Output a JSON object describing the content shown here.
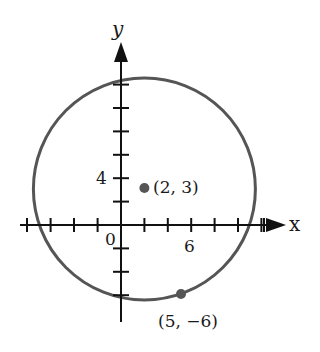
{
  "figure": {
    "axes": {
      "x_label": "x",
      "y_label": "y",
      "origin_label": "0",
      "x_tick_label": "6",
      "y_tick_label": "4",
      "tick_spacing_units": 2
    },
    "circle": {
      "center": [
        2,
        3
      ],
      "radius_sq": 90,
      "stroke_color": "#555555"
    },
    "points": [
      {
        "label": "(2, 3)",
        "x": 2,
        "y": 3
      },
      {
        "label": "(5, −6)",
        "x": 5,
        "y": -6
      }
    ]
  }
}
